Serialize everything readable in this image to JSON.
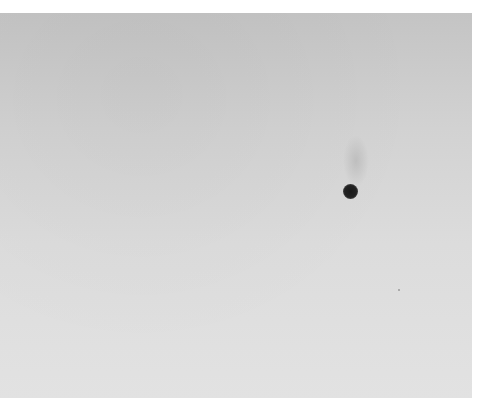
{
  "image": {
    "description": "Grayscale photograph of a plain light-gray surface with a single dark dot",
    "background": {
      "color_top": "#c4c4c4",
      "color_bottom": "#e2e2e2",
      "border_color": "#ffffff"
    },
    "objects": [
      {
        "name": "dark-dot",
        "x": 350,
        "y": 191,
        "diameter": 15,
        "color": "#1a1a1a"
      },
      {
        "name": "faint-smudge",
        "x": 356,
        "y": 160,
        "width": 26,
        "height": 52
      },
      {
        "name": "speck",
        "x": 399,
        "y": 290
      }
    ]
  }
}
